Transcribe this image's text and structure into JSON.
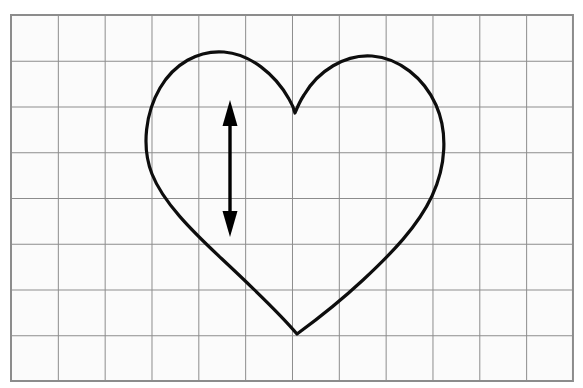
{
  "canvas": {
    "width": 583,
    "height": 388,
    "background_color": "#ffffff",
    "title": "Heart shape on graph paper grid with vertical double-headed arrow"
  },
  "grid": {
    "name": "graph-paper-grid",
    "columns": 12,
    "rows": 8,
    "origin_x": 11,
    "origin_y": 15,
    "cell_width": 46.83,
    "cell_height": 45.75,
    "line_color": "#8c8c8c",
    "line_width": 2,
    "cell_fill_color": "#fbfbfb",
    "total_width": 562,
    "total_height": 366
  },
  "shapes": {
    "heart": {
      "name": "heart-outline",
      "stroke_color": "#0d0d0d",
      "stroke_width": 3.2,
      "fill": "none",
      "bottom_point": {
        "x": 297,
        "y": 334
      },
      "notch_point": {
        "x": 295,
        "y": 113
      },
      "left_lobe_peak": {
        "x": 226,
        "y": 52
      },
      "right_lobe_peak": {
        "x": 376,
        "y": 57
      },
      "left_extreme_x": 148,
      "right_extreme_x": 447,
      "path": "M 297 334 C 281 315 253 288 222 259 C 191 230 163 202 152 174 C 141 146 146 112 160 88 C 174 64 198 50 224 52 C 250 54 275 74 289 99 C 292 104 294 109 295 113 C 297 108 300 101 304 95 C 318 71 345 54 372 56 C 399 58 424 78 436 105 C 448 132 446 166 432 196 C 418 226 392 253 363 280 C 334 307 312 323 297 334 Z"
    },
    "arrow": {
      "name": "vertical-double-headed-arrow",
      "color": "#000000",
      "shaft_x": 230,
      "top_tip_y": 100,
      "bottom_tip_y": 237,
      "shaft_width": 3.4,
      "head_width": 15,
      "head_length": 26,
      "direction": "double",
      "orientation": "vertical",
      "measures": "height of heart interior"
    }
  }
}
